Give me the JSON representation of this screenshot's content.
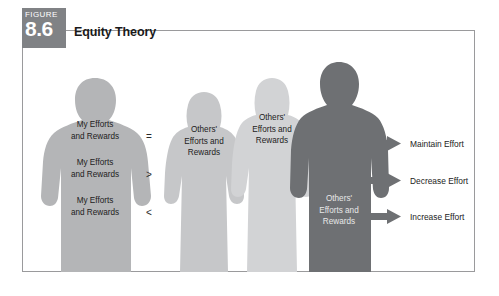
{
  "figure": {
    "tab_word": "FIGURE",
    "number": "8.6",
    "title": "Equity Theory",
    "tab_color": "#808285",
    "border_color": "#9a9a9c",
    "background": "#ffffff"
  },
  "people": [
    {
      "id": "self",
      "name": "self-silhouette",
      "type": "male",
      "color": "#b4b5b7",
      "label_lines": [
        "My Efforts",
        "and Rewards"
      ],
      "label_repeat": 3,
      "text_color": "dark"
    },
    {
      "id": "other-1",
      "name": "other-silhouette-1",
      "type": "female",
      "color": "#c6c7c9",
      "label_lines": [
        "Others'",
        "Efforts and",
        "Rewards"
      ],
      "text_color": "dark"
    },
    {
      "id": "other-2",
      "name": "other-silhouette-2",
      "type": "female",
      "color": "#d2d3d5",
      "label_lines": [
        "Others'",
        "Efforts and",
        "Rewards"
      ],
      "text_color": "dark"
    },
    {
      "id": "other-3",
      "name": "other-silhouette-3",
      "type": "male",
      "color": "#6e7073",
      "label_lines": [
        "Others'",
        "Efforts and",
        "Rewards"
      ],
      "text_color": "light"
    }
  ],
  "comparisons": [
    {
      "symbol": "=",
      "name": "operator-equal"
    },
    {
      "symbol": ">",
      "name": "operator-greater-than"
    },
    {
      "symbol": "<",
      "name": "operator-less-than"
    }
  ],
  "outcomes": [
    {
      "label": "Maintain Effort",
      "name": "outcome-maintain-effort",
      "arrow_color": "#6e7073"
    },
    {
      "label": "Decrease Effort",
      "name": "outcome-decrease-effort",
      "arrow_color": "#6e7073"
    },
    {
      "label": "Increase Effort",
      "name": "outcome-increase-effort",
      "arrow_color": "#6e7073"
    }
  ]
}
